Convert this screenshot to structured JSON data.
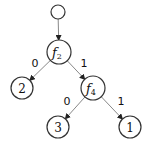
{
  "diagram": {
    "type": "decision-tree",
    "colors": {
      "stroke": "#333333",
      "edge": "#888888",
      "background": "#ffffff"
    },
    "nodes": [
      {
        "id": "root",
        "label": "",
        "x": 58,
        "y": 12,
        "r": 7
      },
      {
        "id": "f2",
        "label": "f",
        "subscript": "2",
        "x": 59,
        "y": 52,
        "r": 12
      },
      {
        "id": "leaf2",
        "label": "2",
        "x": 22,
        "y": 88,
        "r": 11
      },
      {
        "id": "f4",
        "label": "f",
        "subscript": "4",
        "x": 93,
        "y": 88,
        "r": 12
      },
      {
        "id": "leaf3",
        "label": "3",
        "x": 58,
        "y": 127,
        "r": 11
      },
      {
        "id": "leaf1",
        "label": "1",
        "x": 130,
        "y": 127,
        "r": 11
      }
    ],
    "edges": [
      {
        "from": "root",
        "to": "f2",
        "label": ""
      },
      {
        "from": "f2",
        "to": "leaf2",
        "label": "0",
        "lx": 35,
        "ly": 67
      },
      {
        "from": "f2",
        "to": "f4",
        "label": "1",
        "lx": 84,
        "ly": 67
      },
      {
        "from": "f4",
        "to": "leaf3",
        "label": "0",
        "lx": 67,
        "ly": 105
      },
      {
        "from": "f4",
        "to": "leaf1",
        "label": "1",
        "lx": 121,
        "ly": 105
      }
    ]
  }
}
